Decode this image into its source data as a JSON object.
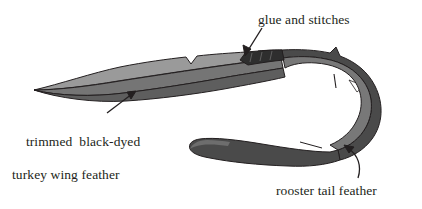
{
  "figure": {
    "background_color": "#ffffff",
    "labels": {
      "glue": "glue and stitches",
      "turkey_line1": "trimmed  black-dyed",
      "turkey_line2": "turkey wing feather",
      "rooster": "rooster tail feather"
    },
    "colors": {
      "light_vane": "#9a9a9a",
      "mid_vane": "#757575",
      "dark_vane": "#4a4a4a",
      "outline": "#231f20",
      "text": "#231f20"
    },
    "parts": [
      {
        "name": "trimmed black-dyed turkey wing feather",
        "shade": "#757575"
      },
      {
        "name": "rooster tail feather",
        "shade": "#4a4a4a"
      },
      {
        "name": "glue and stitches joint",
        "shade": "#231f20"
      }
    ],
    "annotations": [
      {
        "name": "glue-and-stitches-arrow",
        "direction": "down-left"
      },
      {
        "name": "turkey-feather-arrow",
        "direction": "up-right"
      },
      {
        "name": "rooster-feather-arrow",
        "direction": "up-left-curved"
      }
    ]
  }
}
